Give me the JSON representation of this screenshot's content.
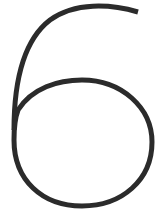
{
  "glyph": {
    "character": "6",
    "stroke_color": "#2b2b2b",
    "background_color": "#ffffff",
    "stroke_width": 5
  }
}
